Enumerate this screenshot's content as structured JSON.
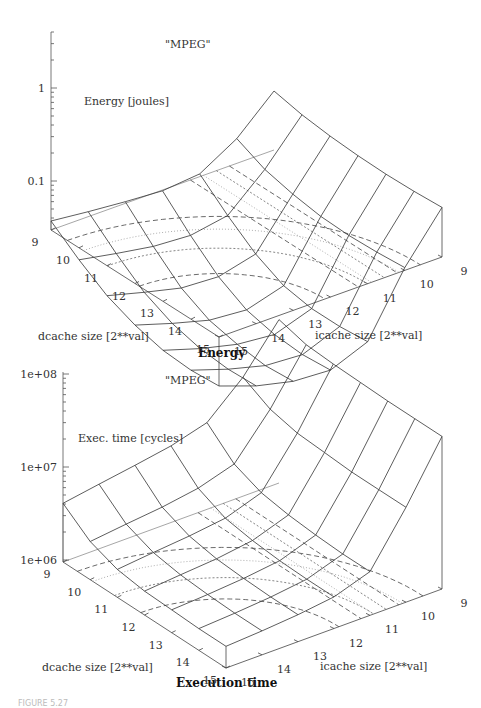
{
  "caption": "FIGURE 5.27",
  "chart_data": [
    {
      "type": "surface",
      "title": "Energy",
      "key": "\"MPEG\"",
      "zlabel": "Energy [joules]",
      "xlabel": "dcache size [2**val]",
      "ylabel": "icache size [2**val]",
      "zscale": "log",
      "zlim": [
        0.03,
        3
      ],
      "zticks": [
        {
          "value": 1,
          "label": "1"
        },
        {
          "value": 0.1,
          "label": "0.1"
        }
      ],
      "dcache": [
        9,
        10,
        11,
        12,
        13,
        14,
        15
      ],
      "icache": [
        9,
        10,
        11,
        12,
        13,
        14,
        15
      ],
      "z_rows_by_dcache": [
        [
          1.45,
          0.62,
          0.36,
          0.33,
          0.35,
          0.38,
          0.42
        ],
        [
          1.25,
          0.45,
          0.2,
          0.17,
          0.18,
          0.21,
          0.25
        ],
        [
          1.15,
          0.38,
          0.12,
          0.095,
          0.1,
          0.125,
          0.16
        ],
        [
          1.1,
          0.34,
          0.085,
          0.065,
          0.07,
          0.09,
          0.12
        ],
        [
          1.08,
          0.33,
          0.075,
          0.055,
          0.06,
          0.075,
          0.1
        ],
        [
          1.1,
          0.34,
          0.075,
          0.052,
          0.055,
          0.07,
          0.095
        ],
        [
          1.15,
          0.36,
          0.08,
          0.055,
          0.058,
          0.072,
          0.1
        ]
      ],
      "contours": "dashed and dotted contour lines projected on base"
    },
    {
      "type": "surface",
      "title": "Execution time",
      "key": "\"MPEG\"",
      "zlabel": "Exec. time [cycles]",
      "xlabel": "dcache size [2**val]",
      "ylabel": "icache size [2**val]",
      "zscale": "log",
      "zlim": [
        1000000,
        100000000
      ],
      "zticks": [
        {
          "value": 100000000,
          "label": "1e+08"
        },
        {
          "value": 10000000,
          "label": "1e+07"
        },
        {
          "value": 1000000,
          "label": "1e+06"
        }
      ],
      "dcache": [
        9,
        10,
        11,
        12,
        13,
        14,
        15
      ],
      "icache": [
        9,
        10,
        11,
        12,
        13,
        14,
        15
      ],
      "z_rows_by_dcache": [
        [
          60000000,
          20000000,
          9000000,
          7000000,
          6000000,
          5200000,
          4500000
        ],
        [
          50000000,
          14000000,
          5000000,
          3800000,
          3300000,
          3000000,
          2700000
        ],
        [
          48000000,
          12000000,
          3800000,
          2800000,
          2500000,
          2300000,
          2100000
        ],
        [
          47000000,
          11500000,
          3400000,
          2500000,
          2200000,
          2050000,
          1900000
        ],
        [
          46000000,
          11000000,
          3200000,
          2350000,
          2100000,
          1950000,
          1850000
        ],
        [
          46000000,
          11000000,
          3100000,
          2300000,
          2050000,
          1900000,
          1800000
        ],
        [
          46000000,
          11000000,
          3100000,
          2300000,
          2050000,
          1900000,
          1800000
        ]
      ],
      "contours": "dashed and dotted contour lines projected on base"
    }
  ]
}
